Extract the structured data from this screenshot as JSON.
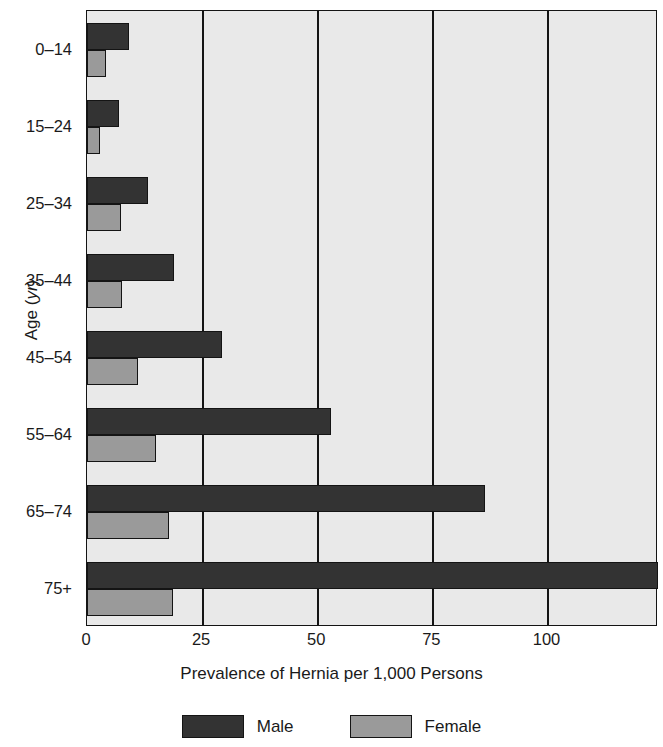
{
  "chart_data": {
    "type": "bar",
    "orientation": "horizontal",
    "title": "",
    "xlabel": "Prevalence of Hernia per 1,000 Persons",
    "ylabel": "Age (yr)",
    "ylabel_main": "Age (",
    "ylabel_unit": "yr",
    "ylabel_close": ")",
    "categories": [
      "0–14",
      "15–24",
      "25–34",
      "35–44",
      "45–54",
      "55–64",
      "65–74",
      "75+"
    ],
    "xlim": [
      0,
      124
    ],
    "xticks": [
      0,
      25,
      50,
      75,
      100
    ],
    "xtick_labels": [
      "0",
      "25",
      "50",
      "75",
      "100"
    ],
    "grid": "vertical",
    "legend_position": "bottom-center",
    "series": [
      {
        "name": "Male",
        "color": "#333333",
        "values": [
          9.1,
          7.0,
          13.3,
          18.9,
          29.3,
          53.0,
          86.5,
          124.0
        ]
      },
      {
        "name": "Female",
        "color": "#9a9a9a",
        "values": [
          4.1,
          2.8,
          7.4,
          7.6,
          11.1,
          15.0,
          17.8,
          18.7
        ]
      }
    ]
  },
  "legend": {
    "entries": [
      {
        "label": "Male",
        "swatch": "male"
      },
      {
        "label": "Female",
        "swatch": "female"
      }
    ]
  },
  "axis": {
    "x_title": "Prevalence of Hernia per 1,000 Persons"
  }
}
